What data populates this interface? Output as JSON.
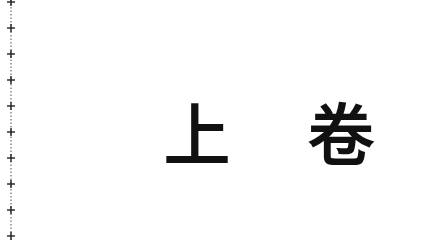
{
  "page": {
    "title_char_1": "上",
    "title_char_2": "卷"
  },
  "margin": {
    "style": "cross-dotted binding line",
    "color": "#222222"
  }
}
